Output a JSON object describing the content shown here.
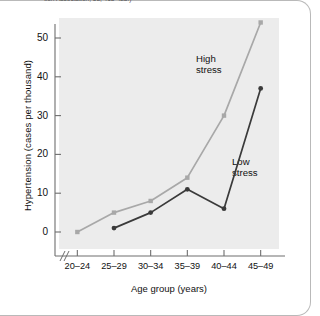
{
  "figure": {
    "top_caption": "tion Association, 58, 413-428.)"
  },
  "chart_data": {
    "type": "line",
    "title": "",
    "subtitle": "",
    "xlabel": "Age group (years)",
    "ylabel": "Hypertension (cases per thousand)",
    "categories": [
      "20–24",
      "25–29",
      "30–34",
      "35–39",
      "40–44",
      "45–49"
    ],
    "ylim": [
      0,
      57
    ],
    "yticks": [
      0,
      10,
      20,
      30,
      40,
      50
    ],
    "ytick_labels": [
      "0",
      "10",
      "20",
      "30",
      "40",
      "50"
    ],
    "grid": false,
    "legend_position": "inline-annotations",
    "x_axis_break": true,
    "series": [
      {
        "name": "High stress",
        "label": "High\nstress",
        "color": "#a8a8a8",
        "marker": "square",
        "values": [
          0,
          5,
          8,
          14,
          30,
          54
        ]
      },
      {
        "name": "Low stress",
        "label": "Low\nstress",
        "color": "#3a3a3a",
        "marker": "circle",
        "values": [
          null,
          1,
          5,
          11,
          6,
          37
        ]
      }
    ],
    "annotations": [
      {
        "text": "High\nstress",
        "series": "High stress"
      },
      {
        "text": "Low\nstress",
        "series": "Low stress"
      }
    ],
    "colors": {
      "plot_background": "#ececec",
      "axis": "#6e6e6e",
      "high_stress": "#a8a8a8",
      "low_stress": "#3a3a3a"
    }
  }
}
